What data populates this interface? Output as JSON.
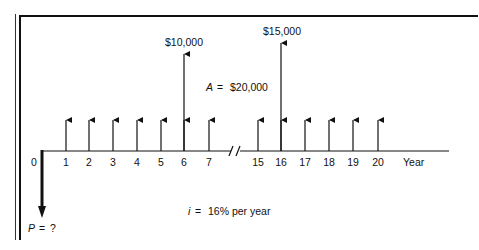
{
  "diagram": {
    "type": "cash-flow-diagram",
    "axis_label": "Year",
    "origin_label": "0",
    "ticks": [
      {
        "label": "1",
        "x": 66
      },
      {
        "label": "2",
        "x": 89
      },
      {
        "label": "3",
        "x": 113
      },
      {
        "label": "4",
        "x": 137
      },
      {
        "label": "5",
        "x": 161
      },
      {
        "label": "6",
        "x": 184
      },
      {
        "label": "7",
        "x": 209
      },
      {
        "label": "15",
        "x": 258
      },
      {
        "label": "16",
        "x": 281
      },
      {
        "label": "17",
        "x": 305
      },
      {
        "label": "18",
        "x": 329
      },
      {
        "label": "19",
        "x": 353
      },
      {
        "label": "20",
        "x": 378
      }
    ],
    "annual_amount": {
      "symbol": "A",
      "eq": "=",
      "value": "$20,000"
    },
    "lump_sums": [
      {
        "year": "6",
        "label": "$10,000"
      },
      {
        "year": "16",
        "label": "$15,000"
      }
    ],
    "present_value": {
      "symbol": "P",
      "eq": "=",
      "value": "?"
    },
    "interest": {
      "symbol": "i",
      "eq": "=",
      "value": "16% per year"
    },
    "break_mark": "//"
  },
  "chart_data": {
    "type": "cash-flow",
    "title": "",
    "xlabel": "Year",
    "interest_rate": "16% per year",
    "inflows": [
      {
        "years": "1-7, 15-20",
        "amount": 20000,
        "label": "A = $20,000"
      },
      {
        "year": 6,
        "amount": 10000,
        "label": "$10,000"
      },
      {
        "year": 16,
        "amount": 15000,
        "label": "$15,000"
      }
    ],
    "outflows": [
      {
        "year": 0,
        "amount": "?",
        "label": "P = ?"
      }
    ],
    "axis_break": "between 7 and 15"
  },
  "colors": {
    "ink": "#111111",
    "background": "#ffffff"
  }
}
